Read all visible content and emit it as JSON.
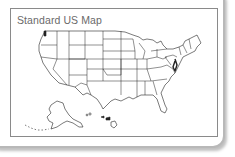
{
  "panel": {
    "title": "Standard US Map"
  },
  "map": {
    "icon": "us-map-outline",
    "regions": [
      "contiguous-us",
      "alaska",
      "hawaii"
    ],
    "stroke_color": "#222222",
    "fill_color": "#ffffff"
  },
  "colors": {
    "card_border": "#b8b8b8",
    "frame_border": "#8a8a8a",
    "title_text": "#6a6a6a"
  }
}
